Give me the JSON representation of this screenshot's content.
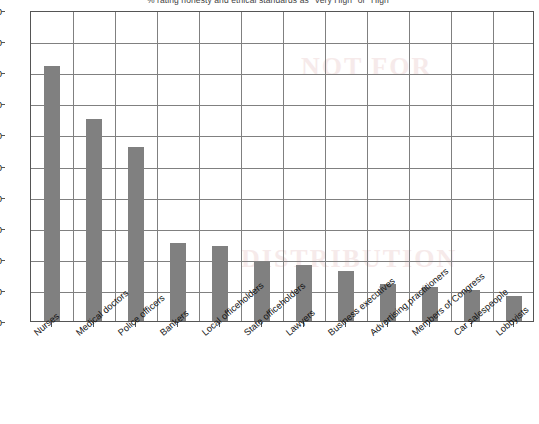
{
  "chart_data": {
    "type": "bar",
    "title": "% rating honesty and ethical standards as \"Very High\" or \"High\"",
    "xlabel": "",
    "ylabel": "",
    "ylim": [
      0,
      100
    ],
    "ytick_step": 10,
    "grid": true,
    "legend": null,
    "bar_color": "#808080",
    "categories": [
      "Nurses",
      "Medical doctors",
      "Police officers",
      "Bankers",
      "Local officeholders",
      "State officeholders",
      "Lawyers",
      "Business executives",
      "Advertising practitioners",
      "Members of Congress",
      "Car salespeople",
      "Lobbyists"
    ],
    "values": [
      82,
      65,
      56,
      25,
      24,
      19,
      18,
      16,
      12,
      11,
      10,
      8
    ],
    "yticks": [
      "0",
      "10",
      "20",
      "30",
      "40",
      "50",
      "60",
      "70",
      "80",
      "90",
      "100"
    ]
  },
  "watermark": {
    "line1": "NOT FOR",
    "line2": "DISTRIBUTION"
  }
}
